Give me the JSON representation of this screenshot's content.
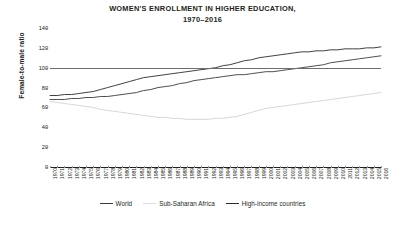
{
  "chart_data": {
    "type": "line",
    "title": "WOMEN'S ENROLLMENT IN HIGHER EDUCATION,",
    "subtitle": "1970–2016",
    "xlabel": "",
    "ylabel": "Female-to-male ratio",
    "ylim": [
      0,
      140
    ],
    "ytick_step": 20,
    "yticks": [
      0,
      20,
      40,
      60,
      80,
      100,
      120,
      140
    ],
    "grid": false,
    "reference_lines": [
      100
    ],
    "legend_position": "bottom",
    "x": [
      1970,
      1971,
      1972,
      1973,
      1974,
      1975,
      1976,
      1977,
      1978,
      1979,
      1980,
      1981,
      1982,
      1983,
      1984,
      1985,
      1986,
      1987,
      1988,
      1989,
      1990,
      1991,
      1992,
      1993,
      1994,
      1995,
      1996,
      1997,
      1998,
      1999,
      2000,
      2001,
      2002,
      2003,
      2004,
      2005,
      2006,
      2007,
      2008,
      2009,
      2010,
      2011,
      2012,
      2013,
      2014,
      2015,
      2016
    ],
    "categories": [
      "1970",
      "1971",
      "1972",
      "1973",
      "1974",
      "1975",
      "1976",
      "1977",
      "1978",
      "1979",
      "1980",
      "1981",
      "1982",
      "1983",
      "1984",
      "1985",
      "1986",
      "1987",
      "1988",
      "1989",
      "1990",
      "1991",
      "1992",
      "1993",
      "1994",
      "1995",
      "1996",
      "1997",
      "1998",
      "1999",
      "2000",
      "2001",
      "2002",
      "2003",
      "2004",
      "2005",
      "2006",
      "2007",
      "2008",
      "2009",
      "2010",
      "2011",
      "2012",
      "2013",
      "2014",
      "2015",
      "2016"
    ],
    "series": [
      {
        "name": "World",
        "color": "#3b3b3b",
        "values": [
          68,
          68,
          68,
          69,
          69,
          70,
          70,
          71,
          71,
          72,
          73,
          74,
          75,
          77,
          78,
          80,
          81,
          82,
          84,
          85,
          87,
          88,
          89,
          90,
          91,
          92,
          93,
          93,
          94,
          95,
          96,
          96,
          97,
          98,
          99,
          100,
          101,
          102,
          103,
          105,
          106,
          107,
          108,
          109,
          110,
          111,
          112
        ]
      },
      {
        "name": "Sub-Saharan Africa",
        "color": "#d3d3d3",
        "values": [
          66,
          65,
          64,
          63,
          62,
          61,
          60,
          58,
          57,
          56,
          55,
          54,
          53,
          52,
          51,
          50,
          50,
          49,
          49,
          48,
          48,
          48,
          48,
          49,
          49,
          50,
          51,
          53,
          55,
          57,
          59,
          60,
          61,
          62,
          63,
          64,
          65,
          66,
          67,
          68,
          69,
          70,
          71,
          72,
          73,
          74,
          75
        ]
      },
      {
        "name": "High-income countries",
        "color": "#2b2b2b",
        "values": [
          72,
          72,
          73,
          73,
          74,
          75,
          76,
          78,
          80,
          82,
          84,
          86,
          88,
          90,
          91,
          92,
          93,
          94,
          95,
          96,
          97,
          98,
          99,
          100,
          102,
          103,
          105,
          107,
          108,
          110,
          111,
          112,
          113,
          114,
          115,
          116,
          116,
          117,
          117,
          118,
          118,
          119,
          119,
          119,
          120,
          120,
          121
        ]
      }
    ]
  },
  "legend": {
    "items": [
      {
        "label": "World",
        "color": "#3b3b3b"
      },
      {
        "label": "Sub-Saharan Africa",
        "color": "#dcdcdc"
      },
      {
        "label": "High-income countries",
        "color": "#2b2b2b"
      }
    ]
  }
}
